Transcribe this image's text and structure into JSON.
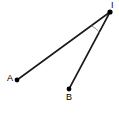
{
  "diagram": {
    "type": "angle-geometry",
    "canvas": {
      "width": 119,
      "height": 137,
      "background": "#ffffff"
    },
    "stroke_color": "#1a1a1a",
    "arc_color": "#8c8c8c",
    "vertex": {
      "id": "I",
      "label": "I",
      "x": 110,
      "y": 12
    },
    "points": [
      {
        "id": "A",
        "label": "A",
        "x": 17,
        "y": 80,
        "dot": true
      },
      {
        "id": "B",
        "label": "B",
        "x": 69,
        "y": 89,
        "dot": true
      }
    ],
    "segments": [
      {
        "name": "segment-IA",
        "from": "I",
        "to": "A",
        "x1": 110,
        "y1": 12,
        "x2": 17,
        "y2": 80
      },
      {
        "name": "segment-IB",
        "from": "I",
        "to": "B",
        "x1": 110,
        "y1": 12,
        "x2": 69,
        "y2": 89
      }
    ],
    "angle_arc": {
      "name": "angle-arc-AIB",
      "vertex": "I",
      "radius": 22,
      "path": "M 91.7 25.9 A 22 22 0 0 1 99.6 32.6"
    }
  }
}
